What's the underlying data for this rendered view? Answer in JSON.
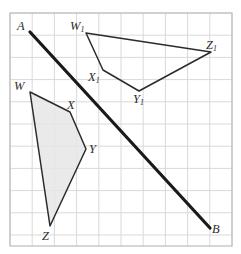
{
  "figure": {
    "canvas": {
      "width": 241,
      "height": 254
    },
    "background_color": "#ffffff"
  },
  "grid": {
    "name": "square-grid",
    "spacing": 22.2,
    "line_color": "#d9d9d9",
    "border_color": "#bdbdbd",
    "x0": 10,
    "y0": 13,
    "x1": 232,
    "y1": 246,
    "columns": 10,
    "rows": 10,
    "visible": true
  },
  "mirror_line": {
    "name": "line-AB",
    "label_start": "A",
    "label_end": "B",
    "color": "#1a1a1a",
    "width": 3.2,
    "start": {
      "x": 30,
      "y": 32
    },
    "end": {
      "x": 210,
      "y": 228
    }
  },
  "shapes": [
    {
      "id": "wxyz",
      "name": "quadrilateral-wxyz",
      "fill": "#e6e6e6",
      "fill_opacity": 0.85,
      "stroke": "#2b2b2b",
      "stroke_width": 1.5,
      "points": "30,92 70,112 86,149 50,226",
      "vertices": [
        {
          "label": "W",
          "sub": "",
          "x": 30,
          "y": 92,
          "label_x": 14,
          "label_y": 80
        },
        {
          "label": "X",
          "sub": "",
          "x": 70,
          "y": 112,
          "label_x": 67,
          "label_y": 99
        },
        {
          "label": "Y",
          "sub": "",
          "x": 86,
          "y": 149,
          "label_x": 89,
          "label_y": 143
        },
        {
          "label": "Z",
          "sub": "",
          "x": 50,
          "y": 226,
          "label_x": 42,
          "label_y": 230
        }
      ]
    },
    {
      "id": "wxyz1",
      "name": "quadrilateral-w1x1y1z1",
      "fill": "none",
      "fill_opacity": 0,
      "stroke": "#2b2b2b",
      "stroke_width": 1.5,
      "points": "86,33 103,70 139,91 211,52",
      "vertices": [
        {
          "label": "W",
          "sub": "1",
          "x": 86,
          "y": 33,
          "label_x": 70,
          "label_y": 20
        },
        {
          "label": "X",
          "sub": "1",
          "x": 103,
          "y": 70,
          "label_x": 88,
          "label_y": 71
        },
        {
          "label": "Y",
          "sub": "1",
          "x": 139,
          "y": 91,
          "label_x": 133,
          "label_y": 93
        },
        {
          "label": "Z",
          "sub": "1",
          "x": 211,
          "y": 52,
          "label_x": 206,
          "label_y": 39
        }
      ]
    }
  ],
  "endpoint_labels": [
    {
      "label": "A",
      "sub": "",
      "x": 17,
      "y": 20,
      "name": "label-A"
    },
    {
      "label": "B",
      "sub": "",
      "x": 212,
      "y": 223,
      "name": "label-B"
    }
  ]
}
